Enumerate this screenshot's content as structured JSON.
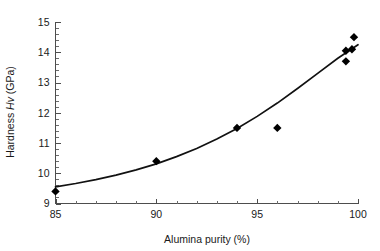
{
  "chart_data": {
    "type": "scatter",
    "title": "",
    "xlabel": "Alumina purity (%)",
    "ylabel": "Hardness Hv (GPa)",
    "ylabel_parts": {
      "prefix": "Hardness ",
      "italic": "Hv",
      "suffix": " (GPa)"
    },
    "xlim": [
      85,
      100
    ],
    "ylim": [
      9,
      15
    ],
    "xticks": [
      85,
      90,
      95,
      100
    ],
    "xtick_labels": [
      "85",
      "90",
      "95",
      "100"
    ],
    "xtick_minor_step": 1,
    "yticks": [
      9,
      10,
      11,
      12,
      13,
      14,
      15
    ],
    "ytick_labels": [
      "9",
      "10",
      "11",
      "12",
      "13",
      "14",
      "15"
    ],
    "ytick_minor_step": 0.2,
    "grid": false,
    "legend": null,
    "marker_style": "filled-diamond",
    "marker_color": "#000000",
    "points": [
      {
        "x": 85.0,
        "y": 9.4
      },
      {
        "x": 90.0,
        "y": 10.4
      },
      {
        "x": 94.0,
        "y": 11.5
      },
      {
        "x": 96.0,
        "y": 11.5
      },
      {
        "x": 99.4,
        "y": 13.7
      },
      {
        "x": 99.4,
        "y": 14.05
      },
      {
        "x": 99.7,
        "y": 14.1
      },
      {
        "x": 99.8,
        "y": 14.5
      }
    ],
    "series": [
      {
        "name": "Hardness data",
        "x": [
          85.0,
          90.0,
          94.0,
          96.0,
          99.4,
          99.4,
          99.7,
          99.8
        ],
        "values": [
          9.4,
          10.4,
          11.5,
          11.5,
          13.7,
          14.05,
          14.1,
          14.5
        ]
      },
      {
        "name": "Fitted trend",
        "type": "line",
        "x": [
          85,
          86,
          87,
          88,
          89,
          90,
          91,
          92,
          93,
          94,
          95,
          96,
          97,
          98,
          99,
          100
        ],
        "values": [
          9.55,
          9.66,
          9.79,
          9.94,
          10.11,
          10.31,
          10.55,
          10.82,
          11.13,
          11.48,
          11.88,
          12.32,
          12.8,
          13.3,
          13.8,
          14.25
        ]
      }
    ],
    "colors": {
      "marker": "#000000",
      "curve": "#111111",
      "axis": "#4d4d4d",
      "text": "#1a1a1a",
      "background": "#ffffff"
    }
  }
}
